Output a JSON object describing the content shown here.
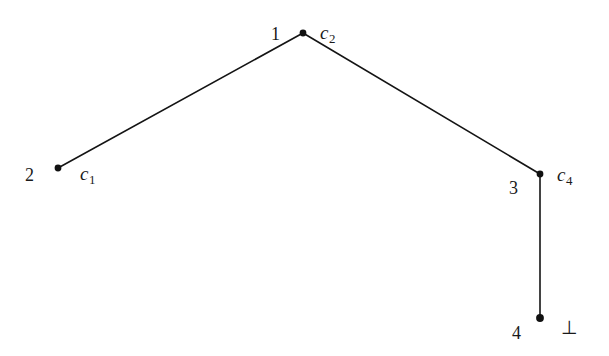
{
  "figure": {
    "background_color": "#ffffff",
    "stroke_color": "#141414",
    "node_color": "#111111",
    "width": 609,
    "height": 356
  },
  "nodes": {
    "apex": {
      "index_label": "1",
      "term_base": "c",
      "term_sub": "2",
      "x": 303,
      "y": 33
    },
    "left": {
      "index_label": "2",
      "term_base": "c",
      "term_sub": "1",
      "x": 58,
      "y": 168
    },
    "right": {
      "index_label": "3",
      "term_base": "c",
      "term_sub": "4",
      "x": 540,
      "y": 174
    },
    "bottom": {
      "index_label": "4",
      "term_base": "⊥",
      "x": 540,
      "y": 318
    }
  },
  "edges": [
    {
      "name": "apex-to-left",
      "x1": 303,
      "y1": 33,
      "x2": 58,
      "y2": 168
    },
    {
      "name": "apex-to-right",
      "x1": 303,
      "y1": 33,
      "x2": 540,
      "y2": 174
    },
    {
      "name": "right-to-bottom",
      "x1": 540,
      "y1": 174,
      "x2": 540,
      "y2": 318
    }
  ]
}
